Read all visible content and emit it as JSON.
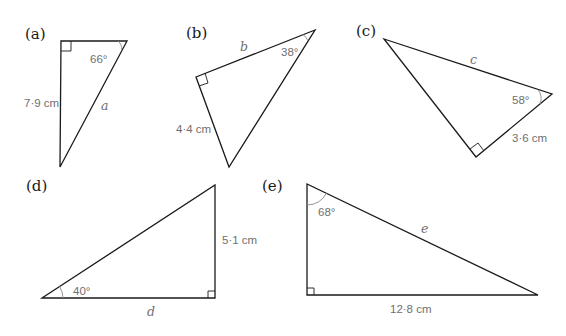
{
  "colors": {
    "line": "#1a1a1a",
    "label_gray": "#6f6f6f",
    "arc_gray": "#8a8a8a",
    "background": "#ffffff"
  },
  "triangles": [
    {
      "panel": "(a)",
      "angle": "66°",
      "side_given": "7·9 cm",
      "unknown": "a",
      "points": "61,41 127,41 60,167",
      "right_angle": "61,51 71,51 71,41",
      "arc": "M 118,41 A 10 10 0 0 1 121.5,50.5"
    },
    {
      "panel": "(b)",
      "angle": "38°",
      "side_given": "4·4 cm",
      "unknown": "b",
      "points": "196,77 315,30 229,167",
      "right_angle": "199,86 208,83 205,73",
      "arc": "M 303,34.5 A 13 13 0 0 1 308,41"
    },
    {
      "panel": "(c)",
      "angle": "58°",
      "side_given": "3·6 cm",
      "unknown": "c",
      "points": "384,39 552,94 476,157",
      "right_angle": "470,149 478,143 484,151",
      "arc": "M 538,89.5 A 15 15 0 0 1 540,104"
    },
    {
      "panel": "(d)",
      "angle": "40°",
      "side_given": "5·1 cm",
      "unknown": "d",
      "points": "42,298 215,185 215,298",
      "right_angle": "208,298 208,291 215,291",
      "arc": "M 63,298 A 21 21 0 0 0 59.5,286.5"
    },
    {
      "panel": "(e)",
      "angle": "68°",
      "side_given": "12·8 cm",
      "unknown": "e",
      "points": "307,184 307,295 538,295",
      "right_angle": "307,288 314,288 314,295",
      "arc": "M 307,205 A 21 21 0 0 0 326.5,193"
    }
  ]
}
